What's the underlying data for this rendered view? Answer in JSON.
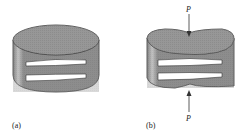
{
  "figure": {
    "panels": [
      {
        "id": "a",
        "label": "(a)",
        "description": "Cylindrical body with two curved slits, undeformed"
      },
      {
        "id": "b",
        "label": "(b)",
        "description": "Cylindrical body compressed by opposing forces",
        "forces": [
          {
            "label": "P",
            "position": "top"
          },
          {
            "label": "P",
            "position": "bottom"
          }
        ]
      }
    ],
    "colors": {
      "body": "#8c8c8c",
      "top": "#9a9a9a",
      "slit": "#ffffff",
      "outline": "#333333",
      "highlight": "#d8d8d8"
    }
  }
}
